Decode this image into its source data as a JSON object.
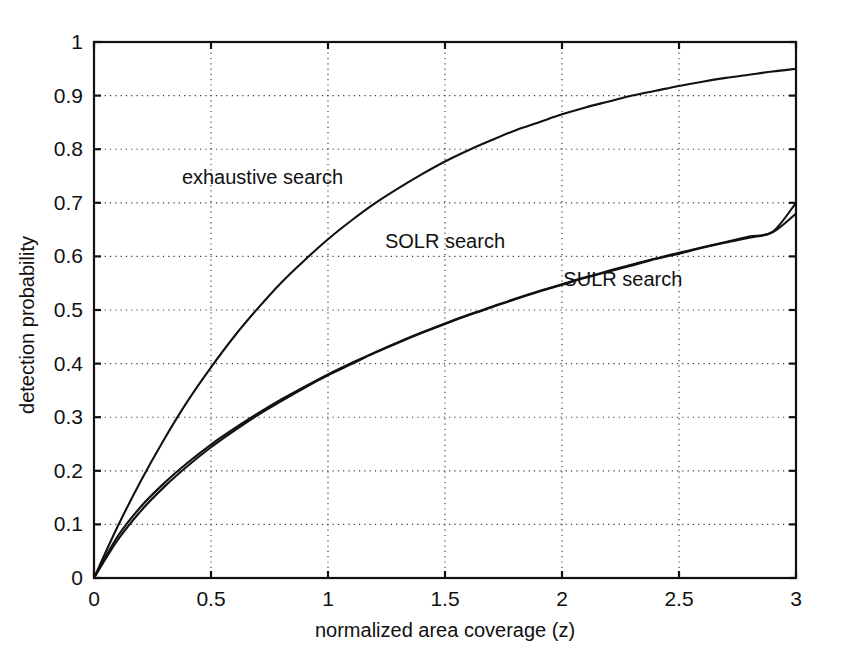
{
  "chart_data": {
    "type": "line",
    "title": "",
    "xlabel": "normalized area coverage (z)",
    "ylabel": "detection probability",
    "xlim": [
      0,
      3
    ],
    "ylim": [
      0,
      1
    ],
    "xticks": [
      0,
      0.5,
      1,
      1.5,
      2,
      2.5,
      3
    ],
    "xticklabels": [
      "0",
      "0.5",
      "1",
      "1.5",
      "2",
      "2.5",
      "3"
    ],
    "yticks": [
      0,
      0.1,
      0.2,
      0.3,
      0.4,
      0.5,
      0.6,
      0.7,
      0.8,
      0.9,
      1
    ],
    "yticklabels": [
      "0",
      "0.1",
      "0.2",
      "0.3",
      "0.4",
      "0.5",
      "0.6",
      "0.7",
      "0.8",
      "0.9",
      "1"
    ],
    "grid": true,
    "grid_style": "dotted",
    "legend_position": "inline-annotations",
    "line_color": "#111111",
    "background_color": "#ffffff",
    "x": [
      0,
      0.1,
      0.2,
      0.3,
      0.4,
      0.5,
      0.6,
      0.7,
      0.8,
      0.9,
      1.0,
      1.1,
      1.2,
      1.3,
      1.4,
      1.5,
      1.6,
      1.7,
      1.8,
      1.9,
      2.0,
      2.1,
      2.2,
      2.3,
      2.4,
      2.5,
      2.6,
      2.7,
      2.8,
      2.9,
      3.0
    ],
    "series": [
      {
        "name": "exhaustive search",
        "label": "exhaustive search",
        "label_x": 0.72,
        "label_y": 0.735,
        "values": [
          0.0,
          0.095,
          0.181,
          0.259,
          0.33,
          0.393,
          0.451,
          0.503,
          0.551,
          0.593,
          0.632,
          0.667,
          0.699,
          0.727,
          0.753,
          0.777,
          0.798,
          0.817,
          0.835,
          0.85,
          0.865,
          0.878,
          0.889,
          0.9,
          0.909,
          0.918,
          0.926,
          0.933,
          0.939,
          0.945,
          0.95
        ]
      },
      {
        "name": "SOLR search",
        "label": "SOLR search",
        "label_x": 1.5,
        "label_y": 0.615,
        "values": [
          0.0,
          0.077,
          0.133,
          0.177,
          0.215,
          0.249,
          0.279,
          0.307,
          0.333,
          0.357,
          0.38,
          0.401,
          0.421,
          0.44,
          0.458,
          0.475,
          0.491,
          0.506,
          0.521,
          0.535,
          0.548,
          0.561,
          0.573,
          0.585,
          0.596,
          0.607,
          0.617,
          0.627,
          0.637,
          0.646,
          0.7
        ]
      },
      {
        "name": "SULR search",
        "label": "SULR search",
        "label_x": 2.26,
        "label_y": 0.545,
        "values": [
          0.0,
          0.07,
          0.125,
          0.17,
          0.209,
          0.244,
          0.275,
          0.304,
          0.33,
          0.355,
          0.378,
          0.399,
          0.42,
          0.439,
          0.457,
          0.474,
          0.49,
          0.505,
          0.52,
          0.534,
          0.547,
          0.56,
          0.572,
          0.583,
          0.595,
          0.605,
          0.616,
          0.626,
          0.635,
          0.645,
          0.68
        ]
      }
    ]
  },
  "figure": {
    "axis_color": "#111111",
    "grid_color": "#3a3a3a"
  }
}
